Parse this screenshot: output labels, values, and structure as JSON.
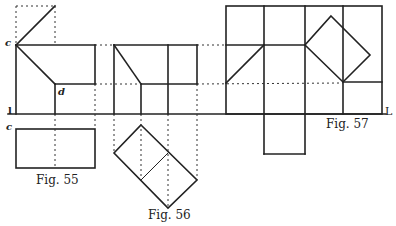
{
  "figures": [
    {
      "id": "fig55",
      "caption": "Fig. 55"
    },
    {
      "id": "fig56",
      "caption": "Fig. 56"
    },
    {
      "id": "fig57",
      "caption": "Fig. 57"
    }
  ],
  "point_labels": {
    "c_top": "c",
    "d": "d",
    "c_bottom": "c",
    "ground_left": "l",
    "ground_right": "L"
  },
  "colors": {
    "ink": "#222222",
    "background": "#ffffff"
  }
}
